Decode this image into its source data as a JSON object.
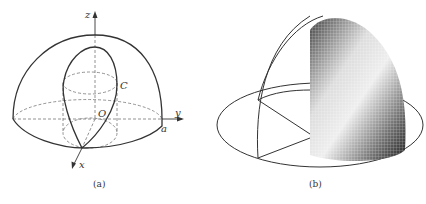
{
  "figure": {
    "panel_a": {
      "caption": "(a)",
      "labels": {
        "z_axis": "z",
        "y_axis": "y",
        "x_axis": "x",
        "origin": "O",
        "curve": "C",
        "radius": "a"
      },
      "description": "Hemisphere of radius a with an inscribed cylinder; the intersection curve C (Viviani curve) shown on the sphere surface, with x, y, z axes through origin O."
    },
    "panel_b": {
      "caption": "(b)",
      "description": "Rendered mesh surface of the portion of the hemisphere cut by the cylinder, with wireframe hemisphere outline and base ellipse."
    },
    "colors": {
      "line": "#333333",
      "dashed": "#777777",
      "background": "#ffffff"
    }
  }
}
